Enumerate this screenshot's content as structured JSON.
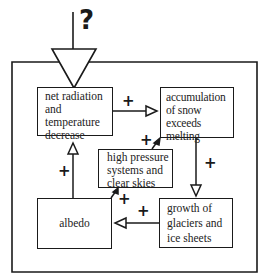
{
  "diagram": {
    "type": "feedback-loop",
    "input_label": "?",
    "nodes": [
      {
        "id": "net",
        "label": "net radiation\nand\ntemperature\ndecrease"
      },
      {
        "id": "acc",
        "label": "accumulation\nof snow\nexceeds melting"
      },
      {
        "id": "hp",
        "label": "high pressure\nsystems and\nclear skies"
      },
      {
        "id": "alb",
        "label": "albedo"
      },
      {
        "id": "gro",
        "label": "growth of\nglaciers and\nice sheets"
      }
    ],
    "edges": [
      {
        "from": "input",
        "to": "net",
        "sign": "?"
      },
      {
        "from": "net",
        "to": "acc",
        "sign": "+"
      },
      {
        "from": "acc",
        "to": "gro",
        "sign": "+"
      },
      {
        "from": "gro",
        "to": "alb",
        "sign": "+"
      },
      {
        "from": "alb",
        "to": "net",
        "sign": "+"
      },
      {
        "from": "alb",
        "to": "hp",
        "sign": "+"
      },
      {
        "from": "hp",
        "to": "acc",
        "sign": "+"
      }
    ],
    "signs": {
      "net_to_acc": "+",
      "acc_to_gro": "+",
      "gro_to_alb": "+",
      "alb_to_net": "+",
      "alb_to_hp": "+",
      "hp_to_acc": "+"
    }
  }
}
